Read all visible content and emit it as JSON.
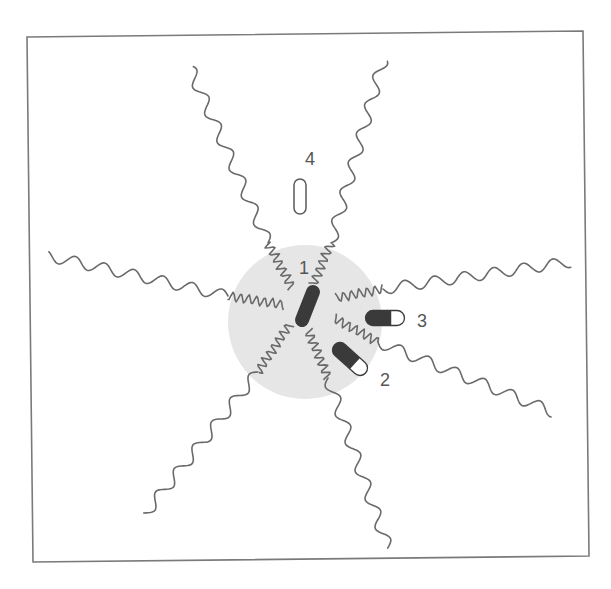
{
  "diagram": {
    "frame": {
      "corners": [
        [
          27,
          37
        ],
        [
          583,
          31
        ],
        [
          589,
          556
        ],
        [
          33,
          562
        ]
      ],
      "stroke": "#7a7a7a"
    },
    "core": {
      "cx": 305,
      "cy": 322,
      "r": 77,
      "fill": "#e6e6e6"
    },
    "chain_color": "#6a6a6a",
    "chains": [
      {
        "name": "chain-upper-left",
        "inner": [
          [
            292,
            288
          ],
          [
            268,
            243
          ]
        ],
        "outer": [
          [
            268,
            243
          ],
          [
            190,
            68
          ]
        ]
      },
      {
        "name": "chain-upper-right",
        "inner": [
          [
            313,
            285
          ],
          [
            331,
            243
          ]
        ],
        "outer": [
          [
            331,
            243
          ],
          [
            383,
            60
          ]
        ]
      },
      {
        "name": "chain-left",
        "inner": [
          [
            284,
            305
          ],
          [
            228,
            296
          ]
        ],
        "outer": [
          [
            228,
            296
          ],
          [
            48,
            256
          ]
        ]
      },
      {
        "name": "chain-right",
        "inner": [
          [
            336,
            298
          ],
          [
            383,
            289
          ]
        ],
        "outer": [
          [
            383,
            289
          ],
          [
            570,
            262
          ]
        ]
      },
      {
        "name": "chain-lower-right",
        "inner": [
          [
            334,
            318
          ],
          [
            378,
            342
          ]
        ],
        "outer": [
          [
            378,
            342
          ],
          [
            553,
            412
          ]
        ]
      },
      {
        "name": "chain-lower",
        "inner": [
          [
            308,
            330
          ],
          [
            328,
            378
          ]
        ],
        "outer": [
          [
            328,
            378
          ],
          [
            388,
            548
          ]
        ]
      },
      {
        "name": "chain-lower-left",
        "inner": [
          [
            290,
            324
          ],
          [
            258,
            372
          ]
        ],
        "outer": [
          [
            258,
            372
          ],
          [
            145,
            514
          ]
        ]
      }
    ],
    "capsules": [
      {
        "id": "1",
        "name": "capsule-1",
        "x1": 313,
        "y1": 292,
        "x2": 302,
        "y2": 320,
        "width": 14,
        "style": "filled"
      },
      {
        "id": "2",
        "name": "capsule-2",
        "x1": 340,
        "y1": 350,
        "x2": 360,
        "y2": 368,
        "width": 15,
        "style": "half"
      },
      {
        "id": "3",
        "name": "capsule-3",
        "x1": 373,
        "y1": 318,
        "x2": 397,
        "y2": 318,
        "width": 15,
        "style": "half"
      },
      {
        "id": "4",
        "name": "capsule-4",
        "x1": 300,
        "y1": 185,
        "x2": 300,
        "y2": 208,
        "width": 12,
        "style": "open"
      }
    ],
    "capsule_fill": "#3a3a3a",
    "labels": [
      {
        "text": "1",
        "x": 299,
        "y": 274
      },
      {
        "text": "2",
        "x": 380,
        "y": 386
      },
      {
        "text": "3",
        "x": 417,
        "y": 327
      },
      {
        "text": "4",
        "x": 305,
        "y": 165
      }
    ]
  }
}
